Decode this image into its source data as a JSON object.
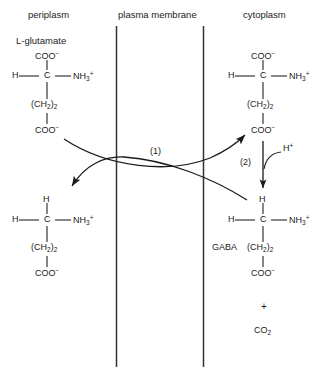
{
  "figure": {
    "headers": {
      "left": "periplasm",
      "middle": "plasma membrane",
      "right": "cytoplasm"
    },
    "molecules": {
      "glutamate_out": {
        "title": "L-glutamate",
        "top": "COO",
        "top_charge": "−",
        "left": "H",
        "center": "C",
        "right": "NH",
        "right_sub": "3",
        "right_charge": "+",
        "chain": "(CH",
        "chain_sub1": "2",
        "chain_close": ")",
        "chain_sub2": "2",
        "bottom": "COO",
        "bottom_charge": "−"
      },
      "glutamate_in": {
        "title": "",
        "top": "COO",
        "top_charge": "−",
        "left": "H",
        "center": "C",
        "right": "NH",
        "right_sub": "3",
        "right_charge": "+",
        "chain": "(CH",
        "chain_sub1": "2",
        "chain_close": ")",
        "chain_sub2": "2",
        "bottom": "COO",
        "bottom_charge": "−"
      },
      "gaba_out": {
        "title": "",
        "top": "H",
        "left": "H",
        "center": "C",
        "right": "NH",
        "right_sub": "3",
        "right_charge": "+",
        "chain": "(CH",
        "chain_sub1": "2",
        "chain_close": ")",
        "chain_sub2": "2",
        "bottom": "COO",
        "bottom_charge": "−"
      },
      "gaba_in": {
        "title": "GABA",
        "top": "H",
        "left": "H",
        "center": "C",
        "right": "NH",
        "right_sub": "3",
        "right_charge": "+",
        "chain": "(CH",
        "chain_sub1": "2",
        "chain_close": ")",
        "chain_sub2": "2",
        "bottom": "COO",
        "bottom_charge": "−"
      }
    },
    "steps": {
      "transport": "(1)",
      "decarboxylation": "(2)"
    },
    "reactants": {
      "proton": "H",
      "proton_charge": "+"
    },
    "products": {
      "plus": "+",
      "co2": "CO",
      "co2_sub": "2"
    },
    "colors": {
      "background": "#ffffff",
      "ink": "#1a1a1a",
      "membrane": "#333333"
    }
  }
}
